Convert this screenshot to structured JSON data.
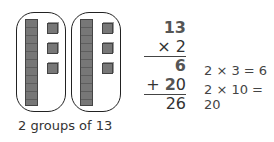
{
  "diagram": {
    "groups": [
      {
        "tens_rods": 1,
        "ones_cubes": 3
      },
      {
        "tens_rods": 1,
        "ones_cubes": 3
      }
    ],
    "caption": "2 groups of 13"
  },
  "calculation": {
    "multiplicand": "13",
    "multiplier_line": "× 2",
    "partial_1": "6",
    "partial_2_sign": "+",
    "partial_2_tens": "2",
    "partial_2_ones": "0",
    "result": "26"
  },
  "explanations": [
    "2 × 3 = 6",
    "2 × 10 = 20"
  ]
}
